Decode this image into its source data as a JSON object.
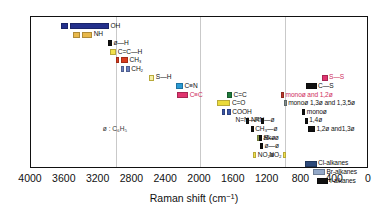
{
  "chart_data": {
    "type": "bar",
    "title": "",
    "xlabel": "Raman shift (cm⁻¹)",
    "ylabel": "",
    "xlim": [
      4000,
      0
    ],
    "x_inverted": true,
    "grid": true,
    "gridlines": [
      3000,
      2000,
      1000
    ],
    "tick_labels": [
      "4000",
      "3600",
      "3200",
      "2800",
      "2400",
      "2000",
      "1600",
      "1200",
      "800",
      "400",
      "0"
    ],
    "tick_values": [
      4000,
      3600,
      3200,
      2800,
      2400,
      2000,
      1600,
      1200,
      800,
      400,
      0
    ],
    "legend_note": "ø : C₆H₅",
    "bands": [
      {
        "label": "OH",
        "color": "#23308c",
        "segments": [
          [
            3650,
            3560
          ],
          [
            3540,
            3080
          ]
        ],
        "label_side": "right",
        "row": 1
      },
      {
        "label": "NH",
        "color": "#e8b84b",
        "segments": [
          [
            3500,
            3420
          ],
          [
            3400,
            3280
          ]
        ],
        "label_side": "right",
        "row": 2
      },
      {
        "label": "ø—H",
        "color": "#111111",
        "segments": [
          [
            3090,
            3040
          ]
        ],
        "label_side": "right",
        "row": 3
      },
      {
        "label": "C=C—H",
        "color": "#f2e14c",
        "segments": [
          [
            3060,
            2990
          ]
        ],
        "label_side": "right",
        "row": 4
      },
      {
        "label": "CH₃",
        "color": "#d83b1e",
        "segments": [
          [
            3000,
            2955
          ],
          [
            2940,
            2860
          ]
        ],
        "label_side": "right",
        "row": 5
      },
      {
        "label": "CH₂",
        "color": "#6a7fc0",
        "segments": [
          [
            2940,
            2895
          ],
          [
            2880,
            2840
          ]
        ],
        "label_side": "right",
        "row": 6
      },
      {
        "label": "S—H",
        "color": "#f7f0a8",
        "segments": [
          [
            2600,
            2540
          ]
        ],
        "label_side": "right",
        "row": 7
      },
      {
        "label": "C≡N",
        "color": "#2a9ad4",
        "segments": [
          [
            2280,
            2200
          ]
        ],
        "label_side": "right",
        "row": 8
      },
      {
        "label": "C≡C",
        "color": "#e0356f",
        "segments": [
          [
            2270,
            2140
          ]
        ],
        "label_side": "right",
        "row": 9
      },
      {
        "label": "C=C",
        "color": "#1f7a3c",
        "segments": [
          [
            1680,
            1620
          ]
        ],
        "label_side": "right",
        "row": 9
      },
      {
        "label": "C=O",
        "color": "#eadb3b",
        "segments": [
          [
            1800,
            1640
          ]
        ],
        "label_side": "right",
        "row": 10
      },
      {
        "label": "COOH",
        "color": "#3b57a8",
        "segments": [
          [
            1740,
            1700
          ],
          [
            1690,
            1650
          ]
        ],
        "label_side": "right",
        "row": 11
      },
      {
        "label": "N=N—R",
        "color": "#111111",
        "segments": [
          [
            1580,
            1550
          ]
        ],
        "label_side": "lead",
        "row": 12
      },
      {
        "label": "N=N—ø",
        "color": "#111111",
        "segments": [
          [
            1450,
            1420
          ]
        ],
        "label_side": "right",
        "row": 12
      },
      {
        "label": "CH₃—ø",
        "color": "#111111",
        "segments": [
          [
            1400,
            1375
          ]
        ],
        "label_side": "right",
        "row": 13
      },
      {
        "label": "alkø",
        "color": "#8f9c4a",
        "segments": [
          [
            1330,
            1270
          ]
        ],
        "label_side": "right",
        "row": 14
      },
      {
        "label": "R—ø",
        "color": "#111111",
        "segments": [
          [
            1300,
            1275
          ]
        ],
        "label_side": "right",
        "row": 14
      },
      {
        "label": "ø—ø",
        "color": "#111111",
        "segments": [
          [
            1290,
            1265
          ]
        ],
        "label_side": "right",
        "row": 15
      },
      {
        "label": "S—S",
        "color": "#e0356f",
        "segments": [
          [
            560,
            490
          ]
        ],
        "label_side": "right",
        "row": 7
      },
      {
        "label": "C—S",
        "color": "#111111",
        "segments": [
          [
            740,
            620
          ]
        ],
        "label_side": "right",
        "row": 8
      },
      {
        "label": "monoø and 1,2ø",
        "color": "#c0392b",
        "segments": [
          [
            1040,
            1020
          ]
        ],
        "label_side": "right",
        "row": 9
      },
      {
        "label": "monoø 1,3ø and 1,3,5ø",
        "color": "#7f8c8d",
        "segments": [
          [
            1010,
            995
          ]
        ],
        "label_side": "right",
        "row": 10
      },
      {
        "label": "monoø",
        "color": "#111111",
        "segments": [
          [
            790,
            770
          ]
        ],
        "label_side": "right",
        "row": 11
      },
      {
        "label": "1,4ø",
        "color": "#111111",
        "segments": [
          [
            760,
            745
          ]
        ],
        "label_side": "right",
        "row": 12
      },
      {
        "label": "1,2ø and1,3ø",
        "color": "#111111",
        "segments": [
          [
            720,
            640
          ]
        ],
        "label_side": "right",
        "row": 13
      },
      {
        "label": "NO₂ø",
        "color": "#f2e14c",
        "segments": [
          [
            1370,
            1350
          ]
        ],
        "label_side": "right",
        "row": 16
      },
      {
        "label": "NO₂",
        "color": "#f2e14c",
        "segments": [
          [
            1180,
            1160
          ]
        ],
        "label_side": "lead",
        "row": 16
      },
      {
        "label": "Cl-alkanes",
        "color": "#2d4a7a",
        "segments": [
          [
            760,
            620
          ]
        ],
        "label_side": "right",
        "row": 17
      },
      {
        "label": "Br-alkanes",
        "color": "#93a8c8",
        "segments": [
          [
            660,
            520
          ]
        ],
        "label_side": "right",
        "row": 18
      },
      {
        "label": "I-alkanes",
        "color": "#111111",
        "segments": [
          [
            620,
            480
          ]
        ],
        "label_side": "right",
        "row": 19
      }
    ]
  }
}
